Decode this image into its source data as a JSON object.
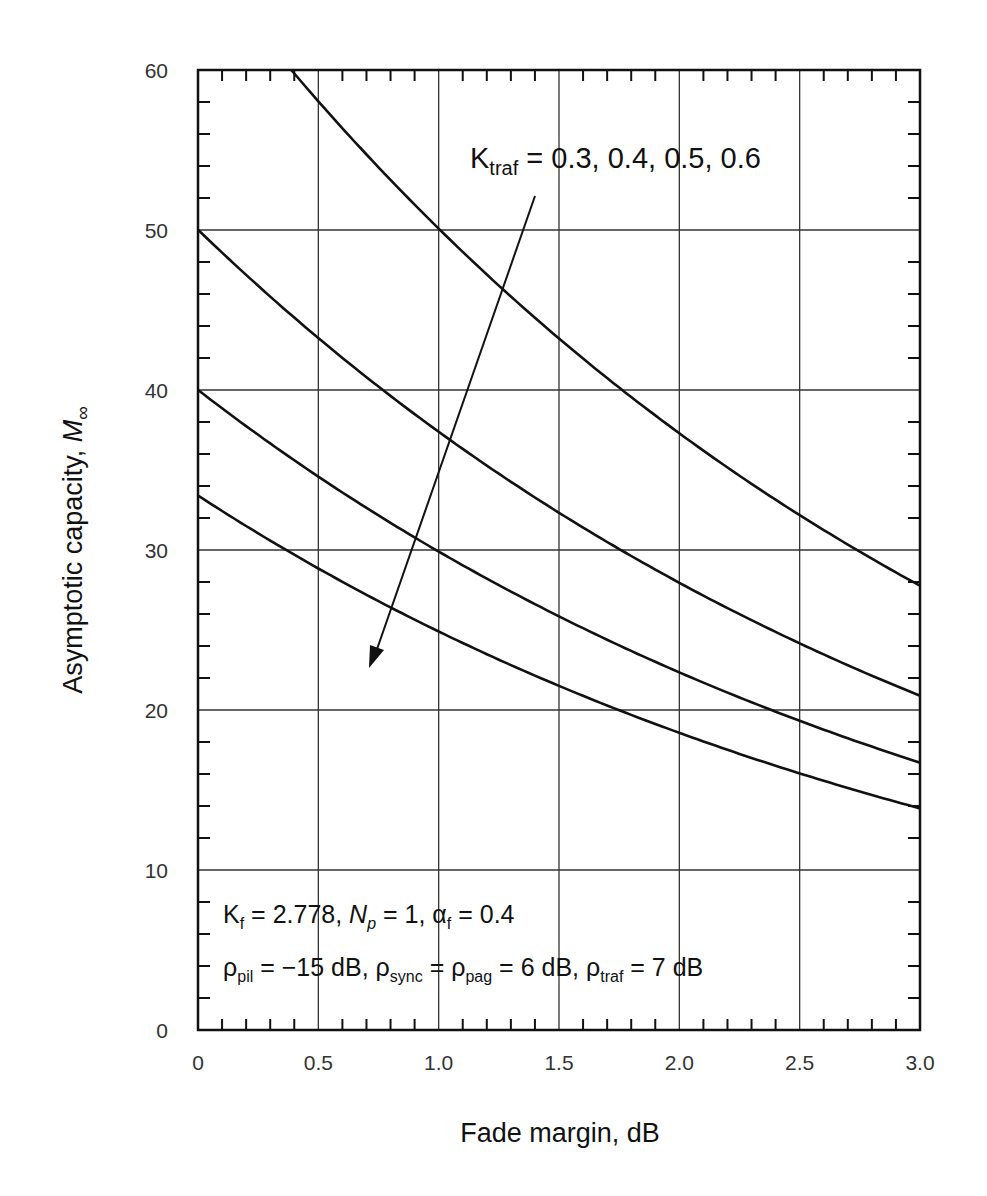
{
  "chart_data": {
    "type": "line",
    "title": "",
    "xlabel": "Fade margin, dB",
    "ylabel": "Asymptotic capacity, M∞",
    "xlim": [
      0,
      3.0
    ],
    "ylim": [
      0,
      60
    ],
    "x_ticks": [
      "0",
      "0.5",
      "1.0",
      "1.5",
      "2.0",
      "2.5",
      "3.0"
    ],
    "y_ticks": [
      "0",
      "10",
      "20",
      "30",
      "40",
      "50",
      "60"
    ],
    "grid": true,
    "legend": null,
    "x": [
      0,
      0.25,
      0.5,
      0.75,
      1.0,
      1.25,
      1.5,
      1.75,
      2.0,
      2.25,
      2.5,
      2.75,
      3.0
    ],
    "series": [
      {
        "name": "K_traf = 0.3",
        "values": [
          null,
          null,
          58.0,
          53.8,
          50.0,
          46.4,
          43.2,
          40.2,
          37.5,
          35.0,
          32.3,
          29.8,
          27.5
        ]
      },
      {
        "name": "K_traf = 0.4",
        "values": [
          49.4,
          46.2,
          43.2,
          40.3,
          37.4,
          34.9,
          32.6,
          30.4,
          28.3,
          26.4,
          24.1,
          22.2,
          20.5
        ]
      },
      {
        "name": "K_traf = 0.5",
        "values": [
          39.5,
          36.9,
          34.5,
          32.2,
          30.0,
          28.0,
          26.2,
          24.3,
          22.5,
          21.0,
          19.3,
          17.8,
          16.4
        ]
      },
      {
        "name": "K_traf = 0.6",
        "values": [
          33.0,
          30.8,
          28.8,
          26.8,
          25.0,
          23.3,
          21.8,
          20.2,
          18.7,
          17.4,
          16.0,
          14.8,
          13.6
        ]
      }
    ],
    "annotations": [
      {
        "text": "K_traf = 0.3, 0.4, 0.5, 0.6",
        "note": "arrow indicating increasing K_traf lowers the curves"
      },
      {
        "text": "K_f = 2.778, N_p = 1, α_f = 0.4"
      },
      {
        "text": "ρ_pil = −15 dB, ρ_sync = ρ_pag = 6 dB, ρ_traf = 7 dB"
      }
    ]
  },
  "labels": {
    "xlabel": "Fade margin, dB",
    "ylabel_main": "Asymptotic capacity, ",
    "ylabel_sym": "M",
    "ylabel_sub": "∞",
    "x_ticks": [
      "0",
      "0.5",
      "1.0",
      "1.5",
      "2.0",
      "2.5",
      "3.0"
    ],
    "y_ticks": [
      "0",
      "10",
      "20",
      "30",
      "40",
      "50",
      "60"
    ],
    "ktraf": {
      "base": "K",
      "sub": "traf",
      "rest": " = 0.3, 0.4, 0.5, 0.6"
    },
    "params1": {
      "kf_base": "K",
      "kf_sub": "f",
      "kf_val": " = 2.778, ",
      "np_base": "N",
      "np_sub": "p",
      "np_val": " = 1, ",
      "af_base": "α",
      "af_sub": "f",
      "af_val": " = 0.4"
    },
    "params2": {
      "p1_base": "ρ",
      "p1_sub": "pil",
      "p1_val": " = −15 dB, ",
      "p2_base": "ρ",
      "p2_sub": "sync",
      "p2_val": " = ",
      "p3_base": "ρ",
      "p3_sub": "pag",
      "p3_val": " = 6 dB, ",
      "p4_base": "ρ",
      "p4_sub": "traf",
      "p4_val": " = 7 dB"
    }
  },
  "style": {
    "line_color": "#111111",
    "grid_color": "#333333",
    "background": "#ffffff"
  }
}
